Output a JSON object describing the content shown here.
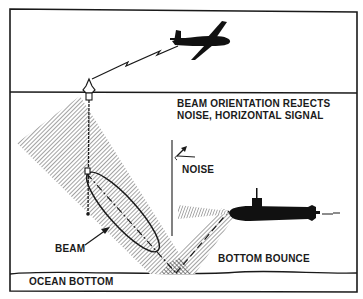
{
  "diagram": {
    "title_lines": [
      "BEAM ORIENTATION REJECTS",
      "NOISE, HORIZONTAL SIGNAL"
    ],
    "labels": {
      "noise": "NOISE",
      "beam": "BEAM",
      "bottom_bounce": "BOTTOM BOUNCE",
      "ocean_bottom": "OCEAN BOTTOM"
    },
    "elements": {
      "aircraft": "patrol-aircraft-silhouette",
      "radio_link": "zigzag-radio-link",
      "sonobuoy": "surface-sonobuoy",
      "hydrophone_cable": "vertical-hydrophone-array",
      "beam_pattern": "elliptical-beam-lobe",
      "submarine": "submarine-silhouette",
      "noise_source": "horizontal-noise-wedge",
      "bounce_path": "bottom-bounce-ray-path"
    },
    "colors": {
      "ink": "#1a1a1a",
      "hatch": "#8a8a8a",
      "background": "#ffffff"
    }
  }
}
